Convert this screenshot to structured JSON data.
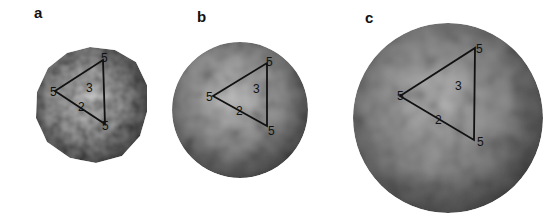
{
  "figure": {
    "panels": [
      {
        "label": "a",
        "label_pos": [
          34,
          4
        ],
        "capsid": {
          "cx": 90,
          "cy": 105,
          "r": 57,
          "texture": "fine"
        },
        "triangle": {
          "v1": [
            55,
            91
          ],
          "v2": [
            103,
            60
          ],
          "v3": [
            105,
            124
          ]
        },
        "symmetry_labels": [
          {
            "text": "5",
            "x": 50,
            "y": 96
          },
          {
            "text": "5",
            "x": 101,
            "y": 62
          },
          {
            "text": "5",
            "x": 102,
            "y": 130
          },
          {
            "text": "3",
            "x": 86,
            "y": 92
          },
          {
            "text": "2",
            "x": 78,
            "y": 111
          }
        ]
      },
      {
        "label": "b",
        "label_pos": [
          197,
          8
        ],
        "capsid": {
          "cx": 240,
          "cy": 110,
          "r": 68,
          "texture": "knobby"
        },
        "triangle": {
          "v1": [
            213,
            96
          ],
          "v2": [
            267,
            63
          ],
          "v3": [
            267,
            126
          ]
        },
        "symmetry_labels": [
          {
            "text": "5",
            "x": 206,
            "y": 101
          },
          {
            "text": "5",
            "x": 266,
            "y": 66
          },
          {
            "text": "5",
            "x": 268,
            "y": 135
          },
          {
            "text": "3",
            "x": 253,
            "y": 93
          },
          {
            "text": "2",
            "x": 236,
            "y": 115
          }
        ]
      },
      {
        "label": "c",
        "label_pos": [
          365,
          9
        ],
        "capsid": {
          "cx": 448,
          "cy": 118,
          "r": 95,
          "texture": "coarse"
        },
        "triangle": {
          "v1": [
            400,
            96
          ],
          "v2": [
            475,
            48
          ],
          "v3": [
            474,
            140
          ]
        },
        "symmetry_labels": [
          {
            "text": "5",
            "x": 397,
            "y": 100
          },
          {
            "text": "5",
            "x": 476,
            "y": 53
          },
          {
            "text": "5",
            "x": 477,
            "y": 146
          },
          {
            "text": "3",
            "x": 455,
            "y": 90
          },
          {
            "text": "2",
            "x": 435,
            "y": 124
          }
        ]
      }
    ],
    "colors": {
      "background": "#ffffff",
      "capsid_light": "#e8e8e8",
      "capsid_mid": "#9a9a9a",
      "capsid_dark": "#3e3e3e",
      "triangle_stroke": "#111111"
    }
  }
}
